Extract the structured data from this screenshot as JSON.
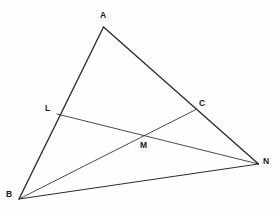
{
  "figure": {
    "name": "triangle-with-cevians",
    "background_color": "#FFFFFF",
    "stroke_color": "#2B2B2B",
    "label_color": "#1A1A1A",
    "width": 279,
    "height": 211
  },
  "points": {
    "A": {
      "label": "A",
      "x": 103.5,
      "y": 27,
      "label_x": 100,
      "label_y": 11
    },
    "B": {
      "label": "B",
      "x": 19,
      "y": 199,
      "label_x": 6,
      "label_y": 190
    },
    "N": {
      "label": "N",
      "x": 258.5,
      "y": 164,
      "label_x": 263,
      "label_y": 157
    },
    "C": {
      "label": "C",
      "x": 196,
      "y": 109.5,
      "label_x": 199,
      "label_y": 99
    },
    "L": {
      "label": "L",
      "x": 57,
      "y": 114,
      "label_x": 45,
      "label_y": 104
    },
    "M": {
      "label": "M",
      "x": 143,
      "y": 137,
      "label_x": 140,
      "label_y": 141
    }
  },
  "segments": [
    {
      "name": "segment-A-B",
      "from": "A",
      "to": "B",
      "width": 1.35
    },
    {
      "name": "segment-A-N",
      "from": "A",
      "to": "N",
      "width": 1.35
    },
    {
      "name": "segment-B-N",
      "from": "B",
      "to": "N",
      "width": 1.0
    },
    {
      "name": "segment-B-C",
      "from": "B",
      "to": "C",
      "width": 0.85
    },
    {
      "name": "segment-L-N",
      "from": "L",
      "to": "N",
      "width": 0.85
    }
  ],
  "labels": [
    {
      "key": "A",
      "name": "point-label-a"
    },
    {
      "key": "B",
      "name": "point-label-b"
    },
    {
      "key": "C",
      "name": "point-label-c"
    },
    {
      "key": "L",
      "name": "point-label-l"
    },
    {
      "key": "M",
      "name": "point-label-m"
    },
    {
      "key": "N",
      "name": "point-label-n"
    }
  ],
  "chart_data": {
    "type": "diagram",
    "title": "",
    "vertices": [
      {
        "id": "A",
        "x": 103.5,
        "y": 27
      },
      {
        "id": "B",
        "x": 19,
        "y": 199
      },
      {
        "id": "N",
        "x": 258.5,
        "y": 164
      },
      {
        "id": "C",
        "x": 196,
        "y": 109.5
      },
      {
        "id": "L",
        "x": 57,
        "y": 114
      },
      {
        "id": "M",
        "x": 143,
        "y": 137
      }
    ],
    "edges": [
      [
        "A",
        "B"
      ],
      [
        "A",
        "N"
      ],
      [
        "B",
        "N"
      ],
      [
        "B",
        "C"
      ],
      [
        "L",
        "N"
      ]
    ]
  }
}
